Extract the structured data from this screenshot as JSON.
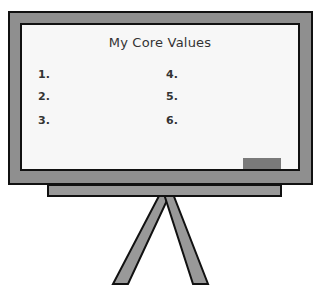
{
  "board": {
    "title": "My Core Values",
    "items": [
      {
        "label": "1."
      },
      {
        "label": "2."
      },
      {
        "label": "3."
      },
      {
        "label": "4."
      },
      {
        "label": "5."
      },
      {
        "label": "6."
      }
    ]
  },
  "colors": {
    "frame": "#8f8f8f",
    "board": "#f7f7f7",
    "outline": "#111111",
    "eraser": "#7a7a7a",
    "tray": "#999999",
    "legs": "#999999"
  }
}
